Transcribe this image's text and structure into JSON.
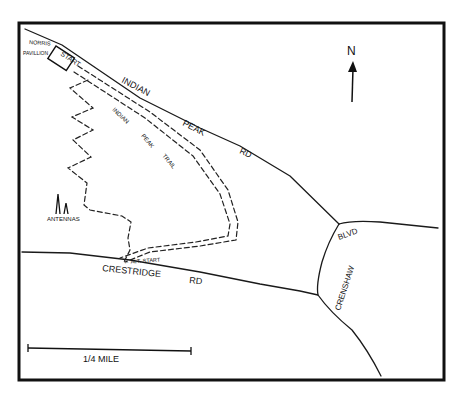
{
  "map": {
    "title": "Indian Peak Trail hand-drawn map",
    "colors": {
      "ink": "#111111",
      "background": "#ffffff"
    },
    "labels": {
      "norris": "NORRIS",
      "pavilion": "PAVILLION",
      "start": "START",
      "indian_peak_rd": [
        "INDIAN",
        "PEAK",
        "RD"
      ],
      "indian_peak_trail": [
        "INDIAN",
        "PEAK",
        "TRAIL"
      ],
      "antennas": "ANTENNAS",
      "alt_start": "← ALT. START",
      "crestridge_rd": [
        "CRESTRIDGE",
        "RD"
      ],
      "crenshaw": "CRENSHAW",
      "blvd": "BLVD",
      "north": "N",
      "scale": "1/4 MILE"
    },
    "icons": {
      "north_arrow": "arrow-up",
      "antennas": "antenna-towers"
    }
  }
}
